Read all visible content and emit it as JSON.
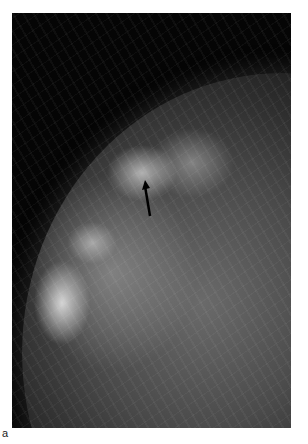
{
  "figure": {
    "panel_label": "a",
    "image_description": "Mammogram (mediolateral view) with dense glandular tissue; arrow marks a region of interest",
    "annotation": {
      "type": "arrow",
      "color": "#000000",
      "points_to": "density in upper-central breast tissue"
    },
    "colors": {
      "background": "#ffffff",
      "frame": "#050505"
    }
  }
}
